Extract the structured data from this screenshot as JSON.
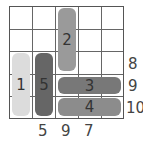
{
  "puzzle": {
    "grid_size": {
      "rows": 5,
      "cols": 5
    },
    "pieces": [
      {
        "id": "1",
        "label": "1",
        "orientation": "vertical",
        "col": 0,
        "row": 2,
        "length": 3,
        "color": "#dcdcdc"
      },
      {
        "id": "5",
        "label": "5",
        "orientation": "vertical",
        "col": 1,
        "row": 2,
        "length": 3,
        "color": "#666666"
      },
      {
        "id": "2",
        "label": "2",
        "orientation": "vertical",
        "col": 2,
        "row": 0,
        "length": 3,
        "color": "#9a9a9a"
      },
      {
        "id": "3",
        "label": "3",
        "orientation": "horizontal",
        "col": 2,
        "row": 3,
        "length": 3,
        "color": "#787878"
      },
      {
        "id": "4",
        "label": "4",
        "orientation": "horizontal",
        "col": 2,
        "row": 4,
        "length": 3,
        "color": "#8c8c8c"
      }
    ],
    "row_clues": [
      {
        "row": 2,
        "value": "8"
      },
      {
        "row": 3,
        "value": "9"
      },
      {
        "row": 4,
        "value": "10"
      }
    ],
    "col_clues": [
      {
        "col": 1,
        "value": "5"
      },
      {
        "col": 2,
        "value": "9"
      },
      {
        "col": 3,
        "value": "7"
      }
    ]
  }
}
